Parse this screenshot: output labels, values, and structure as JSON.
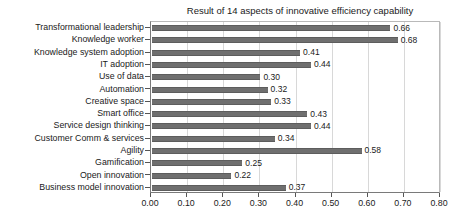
{
  "chart_data": {
    "type": "bar",
    "orientation": "horizontal",
    "title": "Result of 14 aspects of innovative efficiency capability",
    "xlabel": "",
    "ylabel": "",
    "xlim": [
      0.0,
      0.8
    ],
    "xticks": [
      "0.00",
      "0.10",
      "0.20",
      "0.30",
      "0.40",
      "0.50",
      "0.60",
      "0.70",
      "0.80"
    ],
    "xtick_values": [
      0.0,
      0.1,
      0.2,
      0.3,
      0.4,
      0.5,
      0.6,
      0.7,
      0.8
    ],
    "grid": "vertical",
    "legend": "none",
    "bar_color": "#6f6f6f",
    "categories": [
      "Transformational leadership",
      "Knowledge worker",
      "Knowledge system adoption",
      "IT adoption",
      "Use of data",
      "Automation",
      "Creative space",
      "Smart office",
      "Service design thinking",
      "Customer Comm & services",
      "Agility",
      "Gamification",
      "Open innovation",
      "Business model innovation"
    ],
    "values": [
      0.66,
      0.68,
      0.41,
      0.44,
      0.3,
      0.32,
      0.33,
      0.43,
      0.44,
      0.34,
      0.58,
      0.25,
      0.22,
      0.37
    ],
    "value_labels": [
      "0.66",
      "0.68",
      "0.41",
      "0.44",
      "0.30",
      "0.32",
      "0.33",
      "0.43",
      "0.44",
      "0.34",
      "0.58",
      "0.25",
      "0.22",
      "0.37"
    ]
  }
}
